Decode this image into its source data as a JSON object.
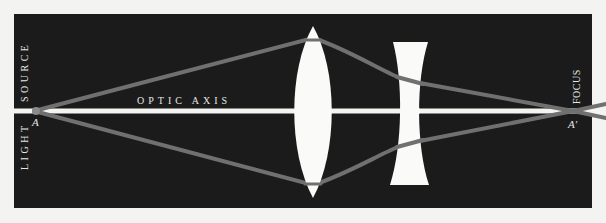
{
  "diagram": {
    "labels": {
      "light": "LIGHT",
      "source": "SOURCE",
      "optic_axis": "OPTIC AXIS",
      "source_point": "A",
      "focus": "FOCUS",
      "focus_point": "A′"
    },
    "elements": [
      {
        "id": "light-source",
        "kind": "point source",
        "label": "A"
      },
      {
        "id": "convex-lens",
        "kind": "biconvex lens"
      },
      {
        "id": "concave-lens",
        "kind": "biconcave lens"
      },
      {
        "id": "focus",
        "kind": "focal point",
        "label": "A′"
      }
    ],
    "colors": {
      "background": "#1b1b1b",
      "axis": "#f4f4f0",
      "rays": "#707070",
      "lenses": "#fafaf8",
      "text": "#e8e8e4"
    }
  }
}
